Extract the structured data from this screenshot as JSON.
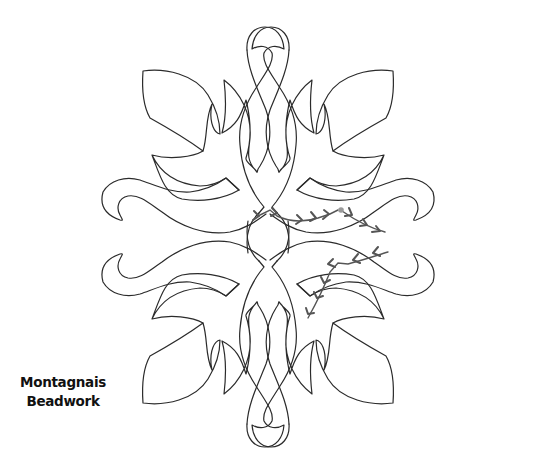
{
  "caption": {
    "line1": "Montagnais",
    "line2": "Beadwork"
  },
  "pattern": {
    "name": "four-fold floral appliqué / quilting motif",
    "symmetry": "4-fold mirror",
    "outline_color": "#2b2b2b",
    "stitch_color": "#555555",
    "start_dot_color": "#9a9a9a"
  }
}
